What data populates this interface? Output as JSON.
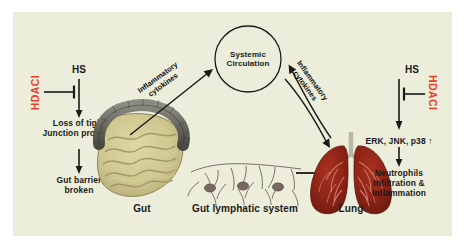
{
  "figure": {
    "background_color": "#eceedb",
    "page_background": "#ffffff",
    "accent_red": "#e8412a",
    "text_color": "#1a1a1a"
  },
  "center": {
    "node_line1": "Systemic",
    "node_line2": "Circulation"
  },
  "left_pathway": {
    "stimulus": "HS",
    "inhibitor": "HDACI",
    "step1_line1": "Loss of tight",
    "step1_line2": "Junction proteins",
    "step2_line1": "Gut barrier",
    "step2_line2": "broken"
  },
  "right_pathway": {
    "stimulus": "HS",
    "inhibitor": "HDACI",
    "step1": "ERK, JNK, p38 ↑",
    "step2_line1": "Neutrophils",
    "step2_line2": "Infiltration &",
    "step2_line3": "Inflammation"
  },
  "arrow_labels": {
    "left_line1": "Inflammatory",
    "left_line2": "cytokines",
    "right_line1": "Inflammatory",
    "right_line2": "cytokines"
  },
  "organ_labels": {
    "gut": "Gut",
    "lymphatic": "Gut lymphatic system",
    "lung": "Lung"
  }
}
